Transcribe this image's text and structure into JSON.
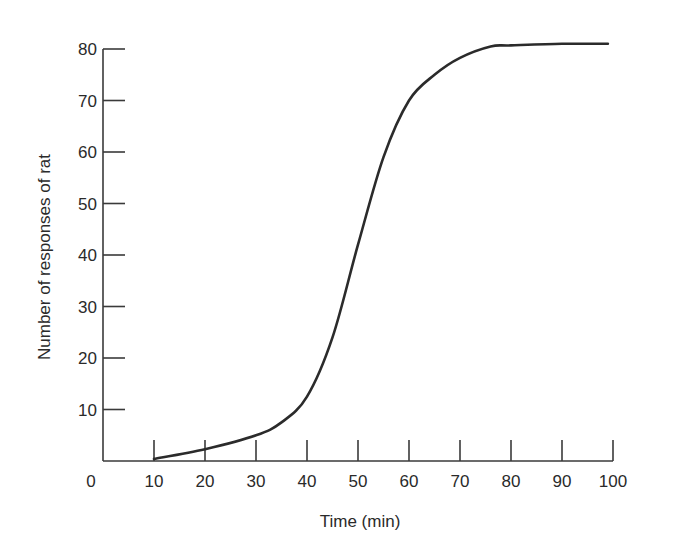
{
  "chart_data": {
    "type": "line",
    "title": "",
    "xlabel": "Time (min)",
    "ylabel": "Number of responses of rat",
    "xlim": [
      0,
      100
    ],
    "ylim": [
      0,
      80
    ],
    "grid": false,
    "legend": null,
    "x_ticks": [
      "0",
      "10",
      "20",
      "30",
      "40",
      "50",
      "60",
      "70",
      "80",
      "90",
      "100"
    ],
    "y_ticks": [
      "10",
      "20",
      "30",
      "40",
      "50",
      "60",
      "70",
      "80"
    ],
    "series": [
      {
        "name": "Cumulative responses",
        "color": "#2b2b2b",
        "x": [
          10,
          20,
          30,
          35,
          40,
          45,
          50,
          55,
          60,
          65,
          70,
          76,
          80,
          90,
          99
        ],
        "y": [
          0.4,
          2.3,
          5.0,
          7.5,
          12.5,
          24,
          42,
          59,
          70,
          75,
          78.3,
          80.5,
          80.7,
          81,
          81
        ]
      }
    ]
  }
}
